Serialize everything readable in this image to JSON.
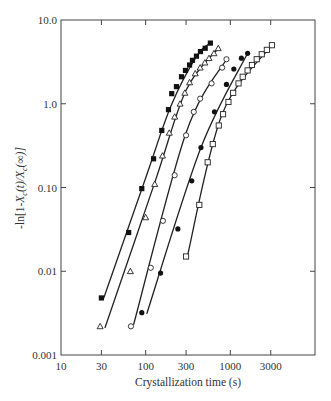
{
  "chart_data": {
    "type": "scatter",
    "title": "",
    "xlabel": "Crystallization time (s)",
    "ylabel": "-ln[1-X_c(t)/X_c(∞)]",
    "xscale": "log",
    "yscale": "log",
    "xlim": [
      10,
      10000
    ],
    "ylim": [
      0.001,
      10.0
    ],
    "xticks": [
      10,
      30,
      100,
      300,
      1000,
      3000
    ],
    "xtick_labels": [
      "10",
      "30",
      "100",
      "300",
      "1000",
      "3000"
    ],
    "yticks": [
      0.001,
      0.01,
      0.1,
      1.0,
      10.0
    ],
    "ytick_labels": [
      "0.001",
      "0.01",
      "0.10",
      "1.0",
      "10.0"
    ],
    "grid": false,
    "legend": null,
    "series": [
      {
        "name": "filled squares",
        "marker": "filled-square",
        "x": [
          30,
          63,
          90,
          124,
          155,
          186,
          203,
          231,
          265,
          295,
          330,
          357,
          398,
          444,
          505,
          581
        ],
        "y": [
          0.0048,
          0.029,
          0.097,
          0.22,
          0.48,
          0.85,
          1.32,
          1.6,
          2.1,
          2.5,
          2.9,
          3.3,
          3.7,
          4.2,
          4.6,
          5.3
        ],
        "fit_line": {
          "x": [
            32,
            100,
            200,
            400,
            581
          ],
          "y": [
            0.0048,
            0.13,
            0.95,
            3.7,
            5.3
          ]
        }
      },
      {
        "name": "open triangles",
        "marker": "open-triangle",
        "x": [
          29,
          66,
          100,
          128,
          158,
          190,
          220,
          255,
          290,
          330,
          385,
          440,
          500,
          560,
          640,
          720
        ],
        "y": [
          0.0022,
          0.01,
          0.044,
          0.11,
          0.24,
          0.45,
          0.7,
          1.0,
          1.35,
          1.8,
          2.3,
          2.7,
          3.1,
          3.5,
          4.0,
          4.6
        ],
        "fit_line": {
          "x": [
            33,
            130,
            300,
            720
          ],
          "y": [
            0.0021,
            0.12,
            1.45,
            4.6
          ]
        }
      },
      {
        "name": "open circles",
        "marker": "open-circle",
        "x": [
          67,
          115,
          160,
          220,
          300,
          370,
          440,
          600,
          800,
          900
        ],
        "y": [
          0.0022,
          0.011,
          0.04,
          0.14,
          0.42,
          0.8,
          1.15,
          1.75,
          2.7,
          3.4
        ],
        "fit_line": {
          "x": [
            72,
            300,
            900
          ],
          "y": [
            0.0023,
            0.45,
            3.4
          ]
        }
      },
      {
        "name": "filled circles",
        "marker": "filled-circle",
        "x": [
          90,
          150,
          240,
          350,
          450,
          650,
          900,
          1100,
          1350,
          1600
        ],
        "y": [
          0.0032,
          0.0095,
          0.032,
          0.12,
          0.3,
          0.8,
          1.7,
          2.6,
          3.5,
          4.0
        ],
        "fit_line": {
          "x": [
            103,
            450,
            1600
          ],
          "y": [
            0.0031,
            0.3,
            4.0
          ]
        }
      },
      {
        "name": "open squares",
        "marker": "open-square",
        "x": [
          300,
          430,
          540,
          620,
          730,
          820,
          950,
          1080,
          1250,
          1400,
          1600,
          1800,
          2050,
          2350,
          2700,
          3100
        ],
        "y": [
          0.015,
          0.062,
          0.2,
          0.33,
          0.55,
          0.75,
          1.05,
          1.35,
          1.75,
          2.1,
          2.5,
          2.9,
          3.4,
          3.9,
          4.4,
          5.0
        ],
        "fit_line": {
          "x": [
            310,
            800,
            3100
          ],
          "y": [
            0.015,
            0.75,
            5.0
          ]
        }
      }
    ]
  }
}
